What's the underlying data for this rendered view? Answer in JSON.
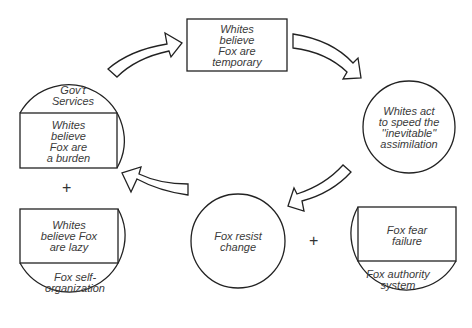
{
  "diagram": {
    "type": "feedback-loop",
    "nodes": {
      "top": {
        "text": "Whites\nbelieve\nFox are\ntemporary",
        "shape": "rectangle"
      },
      "right": {
        "text": "Whites act\nto speed the\n''inevitable''\nassimilation",
        "shape": "circle"
      },
      "bottom": {
        "text": "Fox resist\nchange",
        "shape": "circle"
      },
      "left_top": {
        "outer": "Gov't\nServices",
        "inner": "Whites\nbelieve\nFox are\na burden",
        "shape": "circle-with-rectangle"
      },
      "left_bottom": {
        "inner": "Whites\nbelieve Fox\nare lazy",
        "outer": "Fox self-\norganization",
        "shape": "circle-with-rectangle"
      },
      "right_bottom": {
        "inner": "Fox fear\nfailure",
        "outer": "Fox authority\nsystem",
        "shape": "circle-with-rectangle"
      }
    },
    "operators": {
      "left_plus": "+",
      "bottom_plus": "+"
    },
    "arrows": [
      {
        "from": "left_top",
        "to": "top"
      },
      {
        "from": "top",
        "to": "right"
      },
      {
        "from": "right",
        "to": "bottom"
      },
      {
        "from": "bottom",
        "to": "left_top"
      }
    ],
    "colors": {
      "line": "#222222",
      "text": "#3a3a3a",
      "background": "#ffffff"
    }
  }
}
